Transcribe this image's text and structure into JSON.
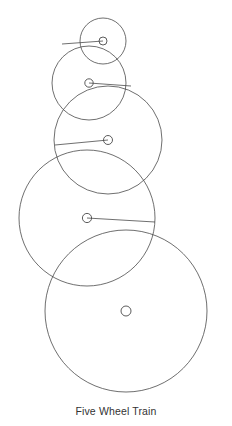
{
  "figure": {
    "caption": "Five Wheel Train",
    "background_color": "#ffffff",
    "stroke_color": "#4a4a4a",
    "caption_color": "#333333",
    "width": 232,
    "height": 426
  },
  "chart_data": {
    "type": "diagram",
    "title": "Five Wheel Train",
    "units": "pixels",
    "grid": false,
    "legend": null,
    "xlabel": "",
    "ylabel": "",
    "wheels": [
      {
        "index": 1,
        "label": "Wheel 1",
        "center_x": 103,
        "center_y": 41,
        "radius": 23,
        "hub_radius": 4.0,
        "spoke_end_x": 62,
        "spoke_end_y": 44
      },
      {
        "index": 2,
        "label": "Wheel 2",
        "center_x": 89,
        "center_y": 83,
        "radius": 37,
        "hub_radius": 4.2,
        "spoke_end_x": 131,
        "spoke_end_y": 86
      },
      {
        "index": 3,
        "label": "Wheel 3",
        "center_x": 108,
        "center_y": 140,
        "radius": 54,
        "hub_radius": 4.5,
        "spoke_end_x": 55,
        "spoke_end_y": 145
      },
      {
        "index": 4,
        "label": "Wheel 4",
        "center_x": 87,
        "center_y": 218,
        "radius": 68,
        "hub_radius": 4.6,
        "spoke_end_x": 155,
        "spoke_end_y": 222
      },
      {
        "index": 5,
        "label": "Wheel 5",
        "center_x": 126,
        "center_y": 311,
        "radius": 81,
        "hub_radius": 5.0,
        "spoke_end_x": 126,
        "spoke_end_y": 311
      }
    ]
  }
}
